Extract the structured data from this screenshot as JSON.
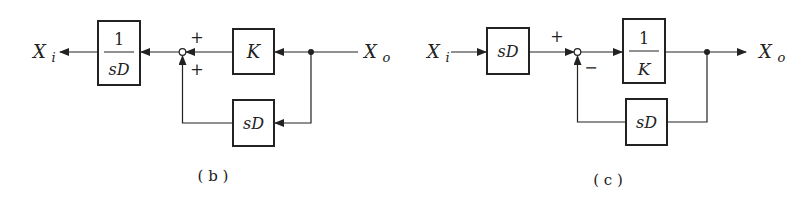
{
  "diagram_b": {
    "caption": "( b )",
    "input_label": "Xo",
    "output_label": "Xi",
    "blocks": {
      "forward": {
        "numerator": "1",
        "denominator": "sD"
      },
      "gain": "K",
      "feedback": "sD"
    },
    "summing_signs": {
      "top": "+",
      "bottom": "+"
    }
  },
  "diagram_c": {
    "caption": "( c )",
    "input_label": "Xi",
    "output_label": "Xo",
    "blocks": {
      "pre": "sD",
      "forward": {
        "numerator": "1",
        "denominator": "K"
      },
      "feedback": "sD"
    },
    "summing_signs": {
      "top": "+",
      "bottom": "−"
    }
  },
  "colors": {
    "line": "#222222",
    "background": "#ffffff"
  }
}
